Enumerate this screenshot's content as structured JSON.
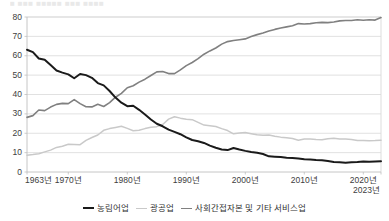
{
  "top_clipped_text": "■ ■■■ ■■■■■ ■■■ ■■■■",
  "colors": {
    "agriculture": "#1a1a1a",
    "mining_manufacturing": "#c9c9c9",
    "services": "#808080",
    "gridline": "#d9d9d9",
    "axis": "#bfbfbf",
    "text": "#404040",
    "background": "#ffffff"
  },
  "axis": {
    "y_ticks": [
      "0",
      "10",
      "20",
      "30",
      "40",
      "50",
      "60",
      "70",
      "80"
    ],
    "x_ticks": [
      "1963년",
      "1970년",
      "1980년",
      "1990년",
      "2000년",
      "2010년",
      "2020년"
    ],
    "x_last_label": "2023년"
  },
  "legend": {
    "items": [
      {
        "label": "농림어업",
        "color": "#1a1a1a",
        "width": "2.2px"
      },
      {
        "label": "광공업",
        "color": "#c9c9c9",
        "width": "1.6px"
      },
      {
        "label": "사회간접자본 및 기타 서비스업",
        "color": "#808080",
        "width": "1.8px"
      }
    ]
  },
  "chart_data": {
    "type": "line",
    "title": "",
    "subtitle": "",
    "xlabel": "",
    "ylabel": "",
    "xlim": [
      1963,
      2023
    ],
    "ylim": [
      0,
      80
    ],
    "y_ticks": [
      0,
      10,
      20,
      30,
      40,
      50,
      60,
      70,
      80
    ],
    "x_ticks": [
      1963,
      1970,
      1980,
      1990,
      2000,
      2010,
      2020,
      2023
    ],
    "grid": "horizontal",
    "legend_position": "bottom-center",
    "units": "percent share of employment",
    "x": [
      1963,
      1964,
      1965,
      1966,
      1967,
      1968,
      1969,
      1970,
      1971,
      1972,
      1973,
      1974,
      1975,
      1976,
      1977,
      1978,
      1979,
      1980,
      1981,
      1982,
      1983,
      1984,
      1985,
      1986,
      1987,
      1988,
      1989,
      1990,
      1991,
      1992,
      1993,
      1994,
      1995,
      1996,
      1997,
      1998,
      1999,
      2000,
      2001,
      2002,
      2003,
      2004,
      2005,
      2006,
      2007,
      2008,
      2009,
      2010,
      2011,
      2012,
      2013,
      2014,
      2015,
      2016,
      2017,
      2018,
      2019,
      2020,
      2021,
      2022,
      2023
    ],
    "series": [
      {
        "name": "농림어업",
        "color": "#1a1a1a",
        "values": [
          63.1,
          61.9,
          58.6,
          57.9,
          55.2,
          52.4,
          51.3,
          50.4,
          48.4,
          50.6,
          50.0,
          48.6,
          45.9,
          44.7,
          41.8,
          38.4,
          35.8,
          34.0,
          34.2,
          32.1,
          29.7,
          27.1,
          24.9,
          23.6,
          21.9,
          20.7,
          19.5,
          17.9,
          16.5,
          15.9,
          15.0,
          13.6,
          12.5,
          11.6,
          11.3,
          12.4,
          11.6,
          10.9,
          10.3,
          9.9,
          9.3,
          8.1,
          7.9,
          7.7,
          7.4,
          7.2,
          7.0,
          6.6,
          6.4,
          6.2,
          6.1,
          5.7,
          5.2,
          5.0,
          4.8,
          5.0,
          5.1,
          5.4,
          5.3,
          5.4,
          5.5
        ]
      },
      {
        "name": "광공업",
        "color": "#c9c9c9",
        "values": [
          8.7,
          9.0,
          9.4,
          10.4,
          11.3,
          12.7,
          13.3,
          14.3,
          14.2,
          14.1,
          16.3,
          17.8,
          19.1,
          21.5,
          22.4,
          23.0,
          23.6,
          22.5,
          21.3,
          21.5,
          22.4,
          23.1,
          23.4,
          24.5,
          27.3,
          28.5,
          27.8,
          27.2,
          27.0,
          25.6,
          24.2,
          23.9,
          23.5,
          22.4,
          21.4,
          19.7,
          20.1,
          20.4,
          19.8,
          19.2,
          19.0,
          19.1,
          18.5,
          18.0,
          17.7,
          17.3,
          16.4,
          17.0,
          17.0,
          16.8,
          16.7,
          17.2,
          17.4,
          17.0,
          17.0,
          16.8,
          16.3,
          16.3,
          16.1,
          16.2,
          16.4
        ]
      },
      {
        "name": "사회간접자본 및 기타 서비스업",
        "color": "#808080",
        "values": [
          28.2,
          29.1,
          32.0,
          31.7,
          33.5,
          34.9,
          35.4,
          35.3,
          37.4,
          35.3,
          33.7,
          33.6,
          35.0,
          33.8,
          35.8,
          38.6,
          40.6,
          43.5,
          44.5,
          46.4,
          47.9,
          49.8,
          51.7,
          51.9,
          50.8,
          50.8,
          52.7,
          54.9,
          56.5,
          58.5,
          60.8,
          62.5,
          64.0,
          66.0,
          67.3,
          67.9,
          68.3,
          68.7,
          69.9,
          70.9,
          71.7,
          72.8,
          73.6,
          74.3,
          74.9,
          75.5,
          76.6,
          76.4,
          76.6,
          77.0,
          77.2,
          77.1,
          77.4,
          78.0,
          78.2,
          78.2,
          78.6,
          78.3,
          78.6,
          78.4,
          79.7
        ]
      }
    ]
  },
  "geometry": {
    "plot_left": 27,
    "plot_right": 381,
    "plot_top": 17,
    "plot_bottom": 172
  }
}
